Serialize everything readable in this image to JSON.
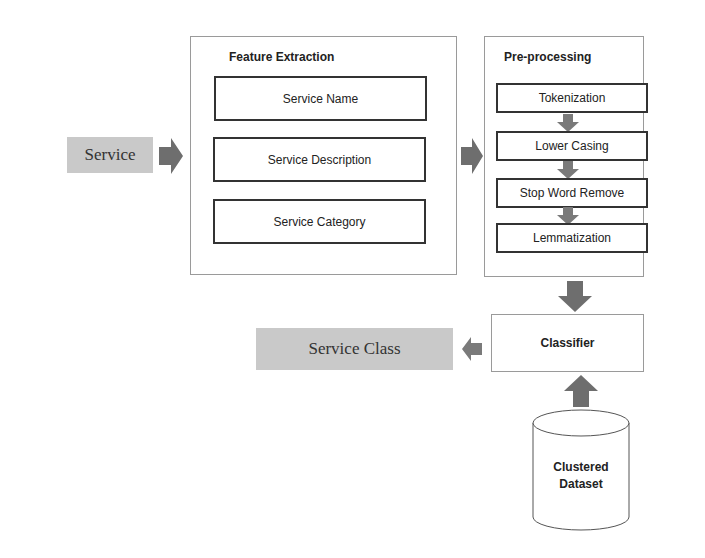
{
  "input": {
    "label": "Service"
  },
  "feature_extraction": {
    "title": "Feature Extraction",
    "items": [
      "Service Name",
      "Service Description",
      "Service Category"
    ]
  },
  "preprocessing": {
    "title": "Pre-processing",
    "steps": [
      "Tokenization",
      "Lower Casing",
      "Stop Word Remove",
      "Lemmatization"
    ]
  },
  "classifier": {
    "label": "Classifier"
  },
  "output": {
    "label": "Service Class"
  },
  "dataset": {
    "line1": "Clustered",
    "line2": "Dataset"
  },
  "colors": {
    "arrow": "#7a7a7a",
    "gray_box": "#c9c9c9"
  }
}
